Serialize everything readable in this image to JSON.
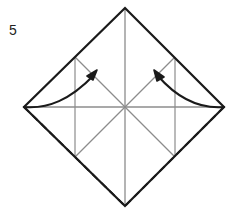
{
  "figure": {
    "kind": "origami-fold-step-diagram",
    "step_label": "5",
    "canvas": {
      "width": 239,
      "height": 215
    },
    "background_color": "#ffffff"
  },
  "colors": {
    "outline": "#1a1a1a",
    "construction_line": "#8c8c8c",
    "fold_line_dashed": "#1a1a1a",
    "arrow": "#1a1a1a",
    "label_text": "#231f20",
    "background": "#ffffff"
  },
  "geometry": {
    "center": {
      "x": 125,
      "y": 107
    },
    "vertices": {
      "top": {
        "x": 125,
        "y": 8
      },
      "left": {
        "x": 24,
        "y": 107
      },
      "right": {
        "x": 224,
        "y": 107
      },
      "bottom": {
        "x": 125,
        "y": 206
      }
    },
    "edge_midpoints": {
      "top_left": {
        "x": 75,
        "y": 57
      },
      "top_right": {
        "x": 175,
        "y": 57
      },
      "bottom_left": {
        "x": 75,
        "y": 157
      },
      "bottom_right": {
        "x": 175,
        "y": 157
      }
    }
  },
  "shapes": {
    "outer_diamond": {
      "label": "Outer square rotated 45 degrees",
      "points": "125,8 224,107 125,206 24,107",
      "stroke_width": 2.2
    },
    "construction_lines": [
      {
        "name": "vertical-axis",
        "x1": 125,
        "y1": 8,
        "x2": 125,
        "y2": 206
      },
      {
        "name": "horizontal-axis",
        "x1": 24,
        "y1": 107,
        "x2": 224,
        "y2": 107
      },
      {
        "name": "inner-square-edge-top-left",
        "x1": 75,
        "y1": 57,
        "x2": 175,
        "y2": 157
      },
      {
        "name": "inner-square-edge-top-right",
        "x1": 175,
        "y1": 57,
        "x2": 75,
        "y2": 157
      }
    ],
    "inner_square_edges": [
      {
        "name": "inner-edge-left",
        "x1": 75,
        "y1": 57,
        "x2": 75,
        "y2": 157
      },
      {
        "name": "inner-edge-right",
        "x1": 175,
        "y1": 57,
        "x2": 175,
        "y2": 157
      }
    ],
    "fold_lines_dashed": [
      {
        "name": "fold-left-to-bottom",
        "x1": 24,
        "y1": 107,
        "x2": 125,
        "y2": 206
      },
      {
        "name": "fold-right-to-bottom",
        "x1": 224,
        "y1": 107,
        "x2": 125,
        "y2": 206
      }
    ],
    "arrows": [
      {
        "name": "fold-arrow-left",
        "path": "M 24,107 Q 55,110 78,88",
        "tip": {
          "x": 97,
          "y": 72
        },
        "direction_deg": -41
      },
      {
        "name": "fold-arrow-right",
        "path": "M 224,107 Q 194,111 172,89",
        "tip": {
          "x": 155,
          "y": 72
        },
        "direction_deg": 221
      }
    ]
  }
}
